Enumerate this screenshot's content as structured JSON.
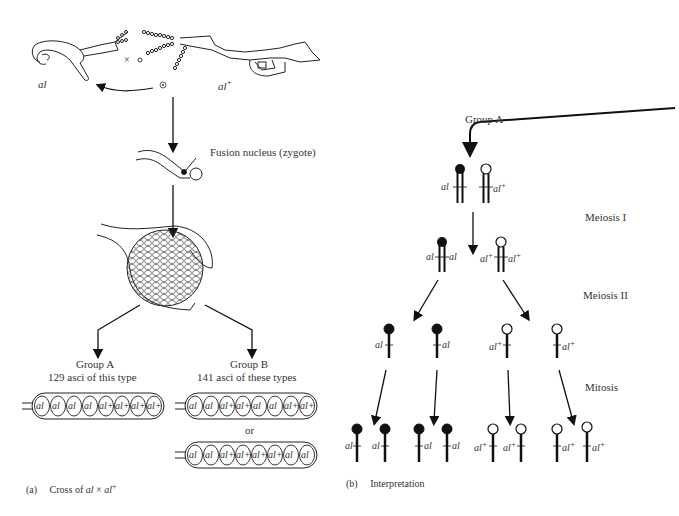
{
  "panel_a": {
    "parent_left": "al",
    "parent_right": "al",
    "parent_right_sup": "+",
    "cross_symbol": "×",
    "fusion_label": "Fusion nucleus (zygote)",
    "group_a": {
      "title": "Group A",
      "subtitle": "129 asci of this type",
      "spores": [
        "al",
        "al",
        "al",
        "al",
        "al+",
        "al+",
        "al+",
        "al+"
      ]
    },
    "group_b": {
      "title": "Group B",
      "subtitle": "141 asci of these types",
      "or_label": "or",
      "ascus1": [
        "al",
        "al",
        "al+",
        "al+",
        "al",
        "al",
        "al+",
        "al+"
      ],
      "ascus2": [
        "al",
        "al",
        "al+",
        "al+",
        "al+",
        "al+",
        "al",
        "al"
      ]
    },
    "caption_tag": "(a)",
    "caption_text": "Cross of",
    "caption_al": "al",
    "caption_times": "×",
    "caption_al2": "al",
    "caption_sup": "+"
  },
  "panel_b": {
    "group_label": "Group A",
    "stage_meiosis1": "Meiosis I",
    "stage_meiosis2": "Meiosis II",
    "stage_mitosis": "Mitosis",
    "allele_mut": "al",
    "allele_wt": "al",
    "wt_sup": "+",
    "caption_tag": "(b)",
    "caption_text": "Interpretation"
  }
}
